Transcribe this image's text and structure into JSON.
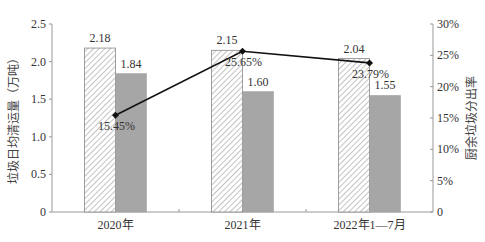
{
  "chart_data": {
    "type": "bar",
    "title": "",
    "categories": [
      "2020年",
      "2021年",
      "2022年1—7月"
    ],
    "series": [
      {
        "name": "垃圾日均清运量(总)",
        "type": "bar",
        "pattern": "hatched",
        "axis": "left",
        "values": [
          2.18,
          2.15,
          2.04
        ],
        "labels": [
          "2.18",
          "2.15",
          "2.04"
        ]
      },
      {
        "name": "垃圾日均清运量(其他)",
        "type": "bar",
        "pattern": "solid-gray",
        "axis": "left",
        "values": [
          1.84,
          1.6,
          1.55
        ],
        "labels": [
          "1.84",
          "1.60",
          "1.55"
        ]
      },
      {
        "name": "厨余垃圾分出率",
        "type": "line",
        "axis": "right",
        "values": [
          15.45,
          25.65,
          23.79
        ],
        "labels": [
          "15.45%",
          "25.65%",
          "23.79%"
        ]
      }
    ],
    "ylabel": "垃圾日均清运量（万吨）",
    "y2label": "厨余垃圾分出率",
    "ylim": [
      0,
      2.5
    ],
    "y2lim": [
      0,
      30
    ],
    "yticks": [
      "0",
      "0.5",
      "1.0",
      "1.5",
      "2.0",
      "2.5"
    ],
    "y2ticks": [
      "0",
      "5%",
      "10%",
      "15%",
      "20%",
      "25%",
      "30%"
    ],
    "grid": false,
    "legend": "none",
    "colors": {
      "hatch": "#777777",
      "solid": "#a6a6a6",
      "line": "#111111",
      "axis": "#999999"
    }
  }
}
